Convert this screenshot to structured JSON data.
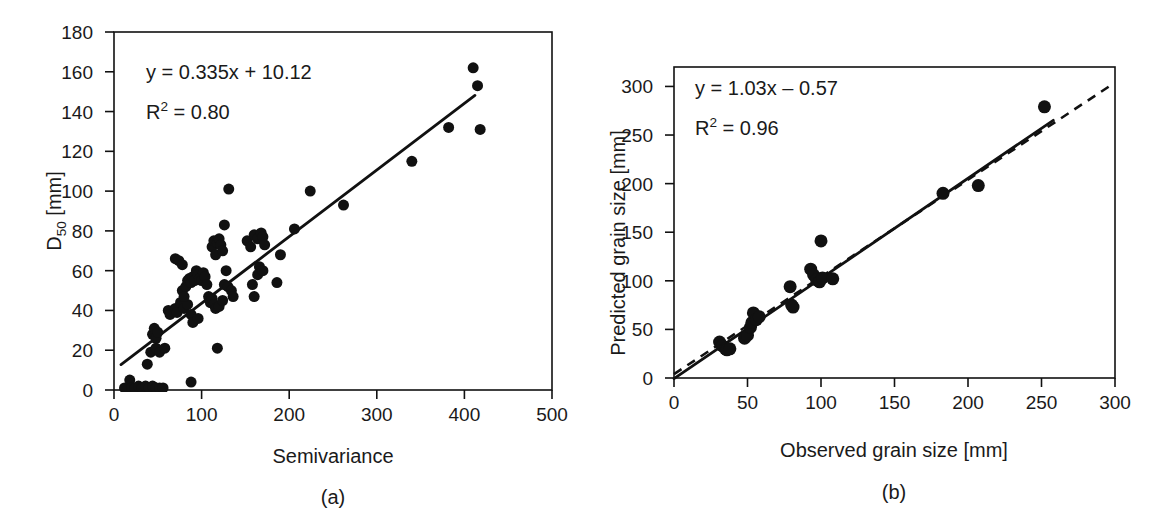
{
  "figure": {
    "background_color": "#ffffff",
    "ink_color": "#111111"
  },
  "panels": [
    {
      "id": "a",
      "caption": "(a)",
      "xlabel": "Semivariance",
      "ylabel_html": "D50 [mm]",
      "ylabel_main": "D",
      "ylabel_sub": "50",
      "ylabel_unit": " [mm]",
      "equation": "y = 0.335x + 10.12",
      "r2_prefix": "R",
      "r2_sup": "2",
      "r2_value": " = 0.80"
    },
    {
      "id": "b",
      "caption": "(b)",
      "xlabel": "Observed grain size [mm]",
      "ylabel_html": "Predicted grain size [mm]",
      "equation": "y = 1.03x – 0.57",
      "r2_prefix": "R",
      "r2_sup": "2",
      "r2_value": " = 0.96"
    }
  ],
  "chart_data": [
    {
      "type": "scatter",
      "panel": "a",
      "title": "(a)",
      "xlabel": "Semivariance",
      "ylabel": "D50 [mm]",
      "xlim": [
        0,
        500
      ],
      "ylim": [
        0,
        180
      ],
      "xticks": [
        0,
        100,
        200,
        300,
        400,
        500
      ],
      "yticks": [
        0,
        20,
        40,
        60,
        80,
        100,
        120,
        140,
        160,
        180
      ],
      "xtick_labels": [
        "0",
        "100",
        "200",
        "300",
        "400",
        "500"
      ],
      "ytick_labels": [
        "0",
        "20",
        "40",
        "60",
        "80",
        "100",
        "120",
        "140",
        "160",
        "180"
      ],
      "grid": false,
      "legend": "none",
      "marker": "filled-circle",
      "marker_color": "#111111",
      "marker_size_px": 11,
      "annotations": [
        "y = 0.335x + 10.12",
        "R2 = 0.80"
      ],
      "fit": {
        "kind": "linear-regression",
        "style": "solid",
        "slope": 0.335,
        "intercept": 10.12,
        "r2": 0.8,
        "x_start": 8,
        "x_end": 412
      },
      "points": [
        [
          12,
          1
        ],
        [
          18,
          5
        ],
        [
          20,
          1
        ],
        [
          24,
          1
        ],
        [
          28,
          2
        ],
        [
          32,
          1
        ],
        [
          36,
          2
        ],
        [
          40,
          1
        ],
        [
          44,
          2
        ],
        [
          48,
          1
        ],
        [
          52,
          1
        ],
        [
          56,
          1
        ],
        [
          88,
          4
        ],
        [
          38,
          13
        ],
        [
          42,
          19
        ],
        [
          48,
          21
        ],
        [
          52,
          19
        ],
        [
          58,
          21
        ],
        [
          44,
          28
        ],
        [
          46,
          31
        ],
        [
          48,
          26
        ],
        [
          50,
          29
        ],
        [
          118,
          21
        ],
        [
          62,
          40
        ],
        [
          64,
          38
        ],
        [
          70,
          41
        ],
        [
          72,
          39
        ],
        [
          76,
          44
        ],
        [
          80,
          41
        ],
        [
          84,
          43
        ],
        [
          88,
          38
        ],
        [
          90,
          34
        ],
        [
          96,
          36
        ],
        [
          78,
          50
        ],
        [
          80,
          47
        ],
        [
          82,
          52
        ],
        [
          84,
          55
        ],
        [
          86,
          56
        ],
        [
          88,
          54
        ],
        [
          90,
          57
        ],
        [
          92,
          55
        ],
        [
          94,
          60
        ],
        [
          96,
          58
        ],
        [
          98,
          56
        ],
        [
          100,
          55
        ],
        [
          102,
          59
        ],
        [
          104,
          57
        ],
        [
          106,
          53
        ],
        [
          108,
          47
        ],
        [
          110,
          44
        ],
        [
          112,
          46
        ],
        [
          114,
          43
        ],
        [
          116,
          41
        ],
        [
          120,
          42
        ],
        [
          124,
          45
        ],
        [
          126,
          53
        ],
        [
          128,
          60
        ],
        [
          130,
          52
        ],
        [
          134,
          50
        ],
        [
          136,
          47
        ],
        [
          70,
          66
        ],
        [
          74,
          65
        ],
        [
          78,
          63
        ],
        [
          112,
          72
        ],
        [
          114,
          75
        ],
        [
          116,
          68
        ],
        [
          118,
          74
        ],
        [
          120,
          76
        ],
        [
          122,
          73
        ],
        [
          124,
          70
        ],
        [
          126,
          83
        ],
        [
          131,
          101
        ],
        [
          152,
          75
        ],
        [
          156,
          72
        ],
        [
          160,
          78
        ],
        [
          164,
          76
        ],
        [
          168,
          79
        ],
        [
          170,
          77
        ],
        [
          172,
          73
        ],
        [
          158,
          53
        ],
        [
          160,
          47
        ],
        [
          164,
          58
        ],
        [
          166,
          62
        ],
        [
          170,
          60
        ],
        [
          186,
          54
        ],
        [
          190,
          68
        ],
        [
          206,
          81
        ],
        [
          224,
          100
        ],
        [
          262,
          93
        ],
        [
          340,
          115
        ],
        [
          382,
          132
        ],
        [
          410,
          162
        ],
        [
          415,
          153
        ],
        [
          418,
          131
        ]
      ]
    },
    {
      "type": "scatter",
      "panel": "b",
      "title": "(b)",
      "xlabel": "Observed grain size [mm]",
      "ylabel": "Predicted grain size [mm]",
      "xlim": [
        0,
        300
      ],
      "ylim": [
        0,
        320
      ],
      "xticks": [
        0,
        50,
        100,
        150,
        200,
        250,
        300
      ],
      "yticks": [
        0,
        50,
        100,
        150,
        200,
        250,
        300
      ],
      "xtick_labels": [
        "0",
        "50",
        "100",
        "150",
        "200",
        "250",
        "300"
      ],
      "ytick_labels": [
        "0",
        "50",
        "100",
        "150",
        "200",
        "250",
        "300"
      ],
      "grid": false,
      "legend": "none",
      "marker": "filled-circle",
      "marker_color": "#111111",
      "marker_size_px": 13,
      "annotations": [
        "y = 1.03x - 0.57",
        "R2 = 0.96"
      ],
      "fit": {
        "kind": "linear-regression",
        "style": "solid",
        "slope": 1.03,
        "intercept": -0.57,
        "r2": 0.96,
        "x_start": 0,
        "x_end": 258
      },
      "reference_line": {
        "kind": "one-to-one",
        "style": "dashed",
        "slope": 1.0,
        "intercept": 4,
        "x_start": 0,
        "x_end": 296
      },
      "points": [
        [
          31,
          37
        ],
        [
          33,
          33
        ],
        [
          35,
          30
        ],
        [
          36,
          29
        ],
        [
          38,
          30
        ],
        [
          48,
          41
        ],
        [
          50,
          44
        ],
        [
          52,
          52
        ],
        [
          53,
          57
        ],
        [
          54,
          67
        ],
        [
          56,
          60
        ],
        [
          58,
          63
        ],
        [
          79,
          94
        ],
        [
          80,
          75
        ],
        [
          81,
          73
        ],
        [
          93,
          112
        ],
        [
          95,
          106
        ],
        [
          97,
          101
        ],
        [
          99,
          99
        ],
        [
          100,
          141
        ],
        [
          101,
          103
        ],
        [
          108,
          102
        ],
        [
          183,
          190
        ],
        [
          207,
          198
        ],
        [
          252,
          279
        ]
      ]
    }
  ]
}
